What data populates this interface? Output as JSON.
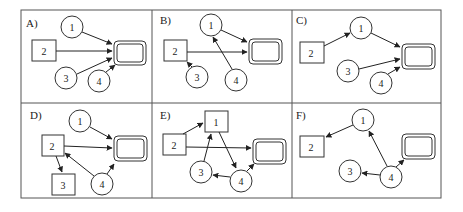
{
  "panels": [
    {
      "label": "A)",
      "x": 21,
      "y": 10
    },
    {
      "label": "B)",
      "x": 152,
      "y": 10
    },
    {
      "label": "C)",
      "x": 292,
      "y": 10
    },
    {
      "label": "D)",
      "x": 21,
      "y": 103
    },
    {
      "label": "E)",
      "x": 152,
      "y": 103
    },
    {
      "label": "F)",
      "x": 292,
      "y": 103
    }
  ],
  "node_labels": {
    "n1": "1",
    "n2": "2",
    "n3": "3",
    "n4": "4"
  },
  "colors": {
    "stroke": "#333333",
    "background": "#ffffff"
  }
}
